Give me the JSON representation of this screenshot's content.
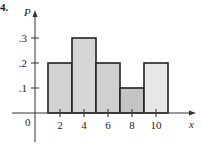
{
  "problem_number": "4.",
  "chart_data": {
    "type": "bar",
    "title": "",
    "xlabel": "x",
    "ylabel": "P",
    "bins": [
      {
        "x0": 1,
        "x1": 3,
        "value": 0.2,
        "fill": "#d2d2d2"
      },
      {
        "x0": 3,
        "x1": 5,
        "value": 0.3,
        "fill": "#d6d6d6"
      },
      {
        "x0": 5,
        "x1": 7,
        "value": 0.2,
        "fill": "#d0d0d0"
      },
      {
        "x0": 7,
        "x1": 9,
        "value": 0.1,
        "fill": "#c4c4c4"
      },
      {
        "x0": 9,
        "x1": 11,
        "value": 0.2,
        "fill": "#e8e8e8"
      }
    ],
    "categories": [
      "1-3",
      "3-5",
      "5-7",
      "7-9",
      "9-11"
    ],
    "values": [
      0.2,
      0.3,
      0.2,
      0.1,
      0.2
    ],
    "x_ticks": [
      2,
      4,
      6,
      8,
      10
    ],
    "x_tick_labels": [
      "2",
      "4",
      "6",
      "8",
      "10"
    ],
    "y_ticks": [
      0.1,
      0.2,
      0.3
    ],
    "y_tick_labels": [
      ".1",
      ".2",
      ".3"
    ],
    "origin_label": "0",
    "xlim": [
      0,
      13
    ],
    "ylim": [
      0,
      0.4
    ],
    "grid": false,
    "legend": null
  }
}
